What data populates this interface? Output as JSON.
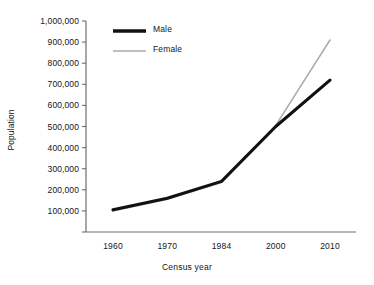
{
  "chart_data": {
    "type": "line",
    "title": "",
    "xlabel": "Census year",
    "ylabel": "Population",
    "categories": [
      "1960",
      "1970",
      "1984",
      "2000",
      "2010"
    ],
    "x": [
      1960,
      1970,
      1984,
      2000,
      2010
    ],
    "series": [
      {
        "name": "Male",
        "color": "#111111",
        "values": [
          105000,
          160000,
          240000,
          500000,
          720000
        ]
      },
      {
        "name": "Female",
        "color": "#aaaaaa",
        "values": [
          100000,
          155000,
          235000,
          505000,
          910000
        ]
      }
    ],
    "ylim": [
      0,
      1000000
    ],
    "ytick_values": [
      0,
      100000,
      200000,
      300000,
      400000,
      500000,
      600000,
      700000,
      800000,
      900000,
      1000000
    ],
    "ytick_labels": [
      "",
      "100,000",
      "200,000",
      "300,000",
      "400,000",
      "500,000",
      "600,000",
      "700,000",
      "800,000",
      "900,000",
      "1,000,000"
    ],
    "grid": false,
    "legend_position": "top-left-inside"
  },
  "axes": {
    "y_title": "Population",
    "x_title": "Census year"
  },
  "legend": {
    "entries": [
      {
        "label": "Male"
      },
      {
        "label": "Female"
      }
    ]
  }
}
